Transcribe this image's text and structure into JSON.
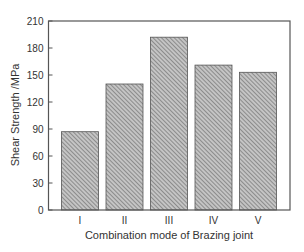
{
  "chart_data": {
    "type": "bar",
    "title": "",
    "xlabel": "Combination mode of Brazing joint",
    "ylabel": "Shear Strength /MPa",
    "categories": [
      "I",
      "II",
      "III",
      "IV",
      "V"
    ],
    "values": [
      87,
      140,
      192,
      161,
      153
    ],
    "ylim": [
      0,
      210
    ],
    "yticks": [
      0,
      30,
      60,
      90,
      120,
      150,
      180,
      210
    ],
    "grid": false,
    "legend": null,
    "bar_fill": "hatched diagonal gray",
    "colors": {
      "bar_fill": "#b8b8b8",
      "bar_hatch": "#6e6e6e",
      "bar_edge": "#555555",
      "axis": "#555555"
    }
  }
}
